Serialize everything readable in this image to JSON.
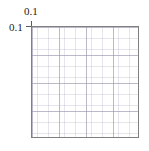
{
  "figure": {
    "background_color": "#ffffff",
    "frame_color": "#808080",
    "grid_color": "#9696af",
    "label_color": "#1a1a1a"
  },
  "axes": {
    "x_tick_labels": [
      "0.1"
    ],
    "y_tick_labels": [
      "0.1"
    ],
    "x_label": "",
    "y_label": "",
    "title": ""
  },
  "chart_data": {
    "type": "scatter",
    "title": "",
    "subtitle": "",
    "xlabel": "",
    "ylabel": "",
    "x": [],
    "y": [],
    "series": [],
    "categories": [],
    "values": [],
    "xticks": [
      0.1
    ],
    "yticks": [
      0.1
    ],
    "xticklabels": [
      "0.1"
    ],
    "yticklabels": [
      "0.1"
    ],
    "xlim": [
      0.1,
      1.0
    ],
    "ylim": [
      0.1,
      1.0
    ],
    "xscale": "log",
    "yscale": "log",
    "grid": true,
    "grid_minor": true,
    "legend": false,
    "legend_position": "none",
    "annotations": []
  }
}
